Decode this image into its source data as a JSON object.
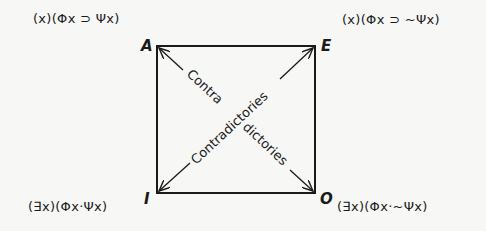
{
  "diagram": {
    "type": "square-of-opposition",
    "corners": {
      "A": {
        "label": "A",
        "formula": "(x)(Φx ⊃ Ψx)"
      },
      "E": {
        "label": "E",
        "formula": "(x)(Φx ⊃ ~Ψx)"
      },
      "I": {
        "label": "I",
        "formula": "(∃x)(Φx·Ψx)"
      },
      "O": {
        "label": "O",
        "formula": "(∃x)(Φx·~Ψx)"
      }
    },
    "diagonals": {
      "ao_part1": "Contra",
      "ao_part2": "dictories",
      "ie_label": "Contradictories"
    },
    "colors": {
      "line": "#1a1a1a",
      "background": "#f7f7f5"
    }
  }
}
